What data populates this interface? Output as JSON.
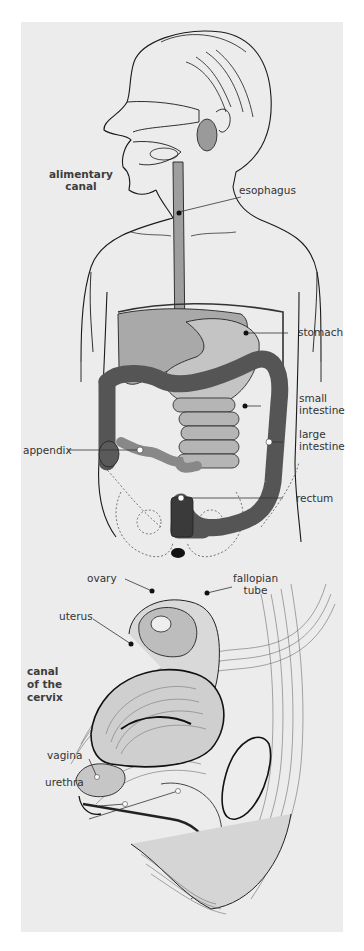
{
  "figure": {
    "panels": [
      {
        "name": "digestive-system",
        "title_label": "alimentary canal",
        "labels": [
          {
            "id": "alimentary_canal",
            "text_lines": [
              "alimentary",
              "canal"
            ],
            "bold": true
          },
          {
            "id": "esophagus",
            "text_lines": [
              "esophagus"
            ]
          },
          {
            "id": "stomach",
            "text_lines": [
              "stomach"
            ]
          },
          {
            "id": "small_intestine",
            "text_lines": [
              "small",
              "intestine"
            ]
          },
          {
            "id": "large_intestine",
            "text_lines": [
              "large",
              "intestine"
            ]
          },
          {
            "id": "appendix",
            "text_lines": [
              "appendix"
            ]
          },
          {
            "id": "rectum",
            "text_lines": [
              "rectum"
            ]
          }
        ]
      },
      {
        "name": "female-pelvis-section",
        "labels": [
          {
            "id": "ovary",
            "text_lines": [
              "ovary"
            ]
          },
          {
            "id": "fallopian_tube",
            "text_lines": [
              "fallopian",
              "tube"
            ]
          },
          {
            "id": "uterus",
            "text_lines": [
              "uterus"
            ]
          },
          {
            "id": "canal_of_the_cervix",
            "text_lines": [
              "canal",
              "of the",
              "cervix"
            ],
            "bold": true
          },
          {
            "id": "vagina",
            "text_lines": [
              "vagina"
            ]
          },
          {
            "id": "urethra",
            "text_lines": [
              "urethra"
            ]
          }
        ]
      }
    ]
  },
  "labels": {
    "alimentary": "alimentary",
    "canal": "canal",
    "esophagus": "esophagus",
    "stomach": "stomach",
    "small": "small",
    "intestine1": "intestine",
    "large": "large",
    "intestine2": "intestine",
    "appendix": "appendix",
    "rectum": "rectum",
    "ovary": "ovary",
    "fallopian": "fallopian",
    "tube": "tube",
    "uterus": "uterus",
    "canal2": "canal",
    "of_the": "of the",
    "cervix": "cervix",
    "vagina": "vagina",
    "urethra": "urethra"
  },
  "colors": {
    "background": "#ececec",
    "ink": "#1a1a1a",
    "organ_light": "#b8b8b8",
    "organ_mid": "#8a8a8a",
    "organ_dark": "#4a4a4a"
  }
}
